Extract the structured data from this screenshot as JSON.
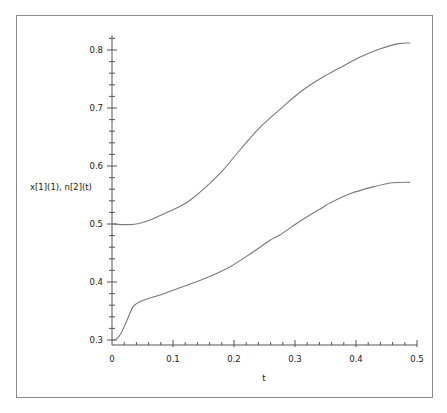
{
  "chart_data": {
    "type": "line",
    "title": "",
    "xlabel": "t",
    "ylabel": "x[1](1), n[2](t)",
    "xlim": [
      0,
      0.5
    ],
    "ylim": [
      0.3,
      0.82
    ],
    "x_ticks": [
      "0",
      "0.1",
      "0.2",
      "0.3",
      "0.4",
      "0.5"
    ],
    "y_ticks": [
      "0.3",
      "0.4",
      "0.5",
      "0.6",
      "0.7",
      "0.8"
    ],
    "grid": false,
    "legend": null,
    "series": [
      {
        "name": "upper curve",
        "x": [
          0,
          0.02,
          0.04,
          0.06,
          0.08,
          0.111,
          0.128,
          0.15,
          0.182,
          0.21,
          0.243,
          0.28,
          0.313,
          0.35,
          0.38,
          0.407,
          0.44,
          0.47,
          0.489
        ],
        "y": [
          0.5,
          0.499,
          0.5,
          0.506,
          0.515,
          0.53,
          0.541,
          0.56,
          0.593,
          0.628,
          0.667,
          0.702,
          0.731,
          0.756,
          0.773,
          0.788,
          0.802,
          0.811,
          0.812
        ]
      },
      {
        "name": "lower curve",
        "x": [
          0,
          0.008,
          0.015,
          0.025,
          0.035,
          0.05,
          0.08,
          0.111,
          0.15,
          0.193,
          0.23,
          0.259,
          0.275,
          0.31,
          0.346,
          0.357,
          0.39,
          0.428,
          0.46,
          0.489
        ],
        "y": [
          0.3,
          0.302,
          0.312,
          0.335,
          0.358,
          0.368,
          0.378,
          0.39,
          0.405,
          0.426,
          0.451,
          0.472,
          0.481,
          0.506,
          0.529,
          0.536,
          0.552,
          0.564,
          0.571,
          0.572
        ]
      }
    ]
  },
  "colors": {
    "line": "#7a7a7a",
    "axis": "#555555",
    "frame": "#8a8a8a"
  }
}
